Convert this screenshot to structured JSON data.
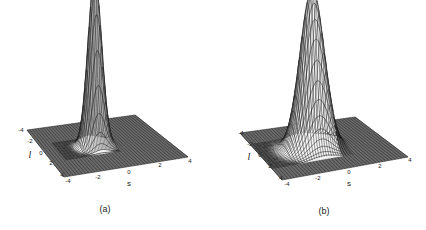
{
  "chart_data": [
    {
      "type": "surface3d",
      "panel": "a",
      "caption": "(a)",
      "xlabel": "s",
      "ylabel": "l",
      "xlim": [
        -4,
        4
      ],
      "ylim": [
        -4,
        4
      ],
      "x_ticks": [
        "-4",
        "-2",
        "0",
        "2",
        "4"
      ],
      "y_ticks": [
        "-4",
        "-2",
        "0",
        "2",
        "4"
      ],
      "surface": "narrow sharp peak centred near s=-0.5, l=0; elongated spike",
      "peak": {
        "s": -0.6,
        "l": 0.0,
        "sigma_s": 0.45,
        "sigma_l": 0.45
      },
      "grid": true
    },
    {
      "type": "surface3d",
      "panel": "b",
      "caption": "(b)",
      "xlabel": "s",
      "ylabel": "l",
      "xlim": [
        -4,
        4
      ],
      "ylim": [
        -4,
        4
      ],
      "x_ticks": [
        "-4",
        "-2",
        "0",
        "2",
        "4"
      ],
      "y_ticks": [
        "-4",
        "-2",
        "0",
        "2",
        "4"
      ],
      "surface": "broader Gaussian peak centred near s=-0.5, l=0",
      "peak": {
        "s": -0.6,
        "l": 0.0,
        "sigma_s": 0.75,
        "sigma_l": 0.75
      },
      "grid": true
    }
  ],
  "panels": [
    {
      "caption": "(a)",
      "xlabel": "s",
      "ylabel": "l",
      "corners": {
        "bl": [
          27,
          130
        ],
        "br": [
          135,
          115
        ],
        "fr": [
          188,
          157
        ],
        "fl": [
          64,
          177
        ]
      },
      "peak_height": 170,
      "sigma": 0.45,
      "s_ticks": [
        {
          "t": "-4",
          "x": 68,
          "y": 181
        },
        {
          "t": "-2",
          "x": 98,
          "y": 177
        },
        {
          "t": "0",
          "x": 129,
          "y": 172
        },
        {
          "t": "2",
          "x": 160,
          "y": 165
        },
        {
          "t": "4",
          "x": 190,
          "y": 161
        }
      ],
      "l_ticks": [
        {
          "t": "-4",
          "x": 21,
          "y": 130
        },
        {
          "t": "-2",
          "x": 30,
          "y": 141
        },
        {
          "t": "0",
          "x": 41,
          "y": 153
        },
        {
          "t": "2",
          "x": 51,
          "y": 163
        },
        {
          "t": "4",
          "x": 62,
          "y": 175
        }
      ],
      "s_label": {
        "x": 129,
        "y": 184
      },
      "l_label": {
        "x": 30,
        "y": 155
      },
      "caption_pos": {
        "x": 105,
        "y": 209
      }
    },
    {
      "caption": "(b)",
      "xlabel": "s",
      "ylabel": "l",
      "corners": {
        "bl": [
          240,
          133
        ],
        "br": [
          355,
          117
        ],
        "fr": [
          408,
          157
        ],
        "fl": [
          282,
          180
        ]
      },
      "peak_height": 160,
      "sigma": 0.75,
      "s_ticks": [
        {
          "t": "-4",
          "x": 287,
          "y": 184
        },
        {
          "t": "-2",
          "x": 318,
          "y": 178
        },
        {
          "t": "0",
          "x": 349,
          "y": 172
        },
        {
          "t": "2",
          "x": 380,
          "y": 166
        },
        {
          "t": "4",
          "x": 410,
          "y": 160
        }
      ],
      "l_ticks": [
        {
          "t": "-4",
          "x": 241,
          "y": 133
        },
        {
          "t": "-2",
          "x": 250,
          "y": 144
        },
        {
          "t": "0",
          "x": 260,
          "y": 155
        },
        {
          "t": "2",
          "x": 270,
          "y": 166
        },
        {
          "t": "4",
          "x": 281,
          "y": 178
        }
      ],
      "s_label": {
        "x": 349,
        "y": 184
      },
      "l_label": {
        "x": 249,
        "y": 157
      },
      "caption_pos": {
        "x": 324,
        "y": 211
      }
    }
  ]
}
